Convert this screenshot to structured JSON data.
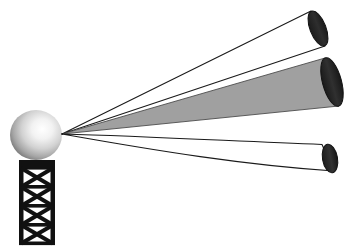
{
  "figure": {
    "canvas": {
      "width": 351,
      "height": 250,
      "background": "#ffffff"
    }
  },
  "palette": {
    "outline": "#1a1a1a",
    "beam_fill_gray": "#a0a0a0",
    "beam_fill_white": "#ffffff",
    "cap_dark": "#262626",
    "cap_dark_2": "#333333",
    "tower_dark": "#111111",
    "sphere_light": "#ffffff",
    "sphere_mid": "#cfcfcf",
    "sphere_dark": "#6e6e6e",
    "sphere_shadow": "#4a4a4a"
  },
  "emitter": {
    "radome_label": "spherical radome",
    "sphere": {
      "cx": 36,
      "cy": 135,
      "rx": 26,
      "ry": 25
    },
    "apex": {
      "x": 62,
      "y": 134
    },
    "tower": {
      "label": "lattice mast",
      "x": 18,
      "y": 161,
      "width": 38,
      "height": 84,
      "cap_height": 9,
      "bays": 4,
      "strut_width": 4
    }
  },
  "beams": [
    {
      "name": "upper-beam",
      "style": "outline",
      "fill": "#ffffff",
      "cap_fill": "#262626",
      "path": "M62,134 L311,11 L325,46 Z",
      "upper_edge": "M62,134 L311,11",
      "lower_edge": "M62,134 L325,46",
      "cap": {
        "cx": 318,
        "cy": 28.5,
        "rx": 8,
        "ry": 18.5,
        "rotate": -21
      }
    },
    {
      "name": "middle-beam",
      "style": "filled",
      "fill": "#a0a0a0",
      "cap_fill": "#262626",
      "path": "M62,134 L325,58 L339,106 Z",
      "upper_edge": "M62,134 L325,58",
      "lower_edge": "M62,134 L339,106",
      "cap": {
        "cx": 332,
        "cy": 82,
        "rx": 9.5,
        "ry": 25,
        "rotate": -15
      }
    },
    {
      "name": "lower-beam",
      "style": "outline-curved",
      "fill": "#ffffff",
      "cap_fill": "#262626",
      "upper_edge": "M62,134 C150,137 230,142 323,145",
      "lower_edge": "M62,134 C160,150 250,164 336,172",
      "cap": {
        "cx": 330,
        "cy": 158.5,
        "rx": 7.5,
        "ry": 14.5,
        "rotate": -10
      }
    }
  ],
  "annotations": {
    "beam_count": 3,
    "filled_beam_index": 1
  }
}
